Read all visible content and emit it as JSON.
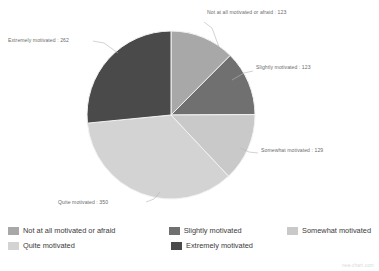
{
  "chart_data": {
    "type": "pie",
    "title": "",
    "categories": [
      "Not at all motivated or afraid",
      "Slightly motivated",
      "Somewhat motivated",
      "Quite motivated",
      "Extremely motivated"
    ],
    "values": [
      123,
      123,
      129,
      350,
      262
    ],
    "total": 987,
    "colors": [
      "#a8a8a8",
      "#707070",
      "#c9c9c9",
      "#d3d3d3",
      "#4a4a4a"
    ],
    "start_angle_deg": 0,
    "direction": "clockwise",
    "grid": false,
    "legend_position": "bottom",
    "slice_labels": [
      "Not at all motivated or afraid : 123",
      "Slightly motivated : 123",
      "Somewhat motivated : 129",
      "Quite motivated : 350",
      "Extremely motivated : 262"
    ]
  },
  "callouts": [
    {
      "text": "Not at all motivated or afraid : 123"
    },
    {
      "text": "Slightly motivated : 123"
    },
    {
      "text": "Somewhat motivated : 129"
    },
    {
      "text": "Quite motivated : 350"
    },
    {
      "text": "Extremely motivated : 262"
    }
  ],
  "legend": {
    "items": [
      {
        "label": "Not at all motivated or afraid",
        "color": "#a8a8a8"
      },
      {
        "label": "Slightly motivated",
        "color": "#707070"
      },
      {
        "label": "Somewhat motivated",
        "color": "#c9c9c9"
      },
      {
        "label": "Quite motivated",
        "color": "#d3d3d3"
      },
      {
        "label": "Extremely motivated",
        "color": "#4a4a4a"
      }
    ]
  },
  "watermark": {
    "text": "nea-chart.com"
  }
}
